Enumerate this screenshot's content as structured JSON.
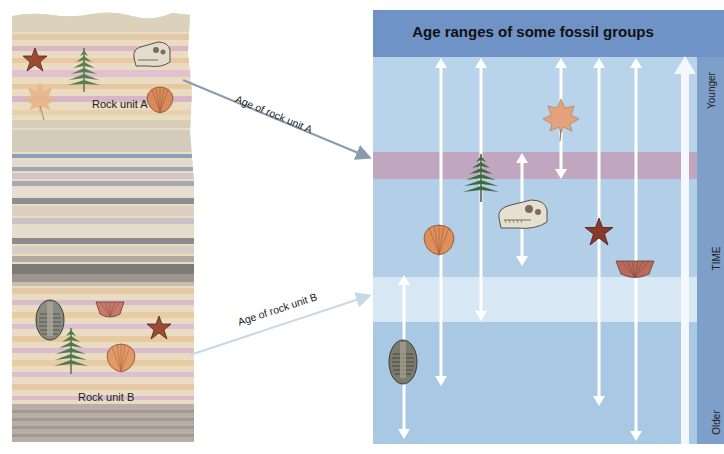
{
  "left_column": {
    "rock_unit_a_label": "Rock unit A",
    "rock_unit_b_label": "Rock unit B",
    "rock_unit_a_fossils": [
      "starfish",
      "fern",
      "dinosaur-skull",
      "maple-leaf",
      "scallop-shell"
    ],
    "rock_unit_b_fossils": [
      "trilobite",
      "brachiopod",
      "starfish",
      "fern",
      "scallop-shell"
    ]
  },
  "connectors": {
    "unit_a_label": "Age of rock unit A",
    "unit_b_label": "Age of rock unit B"
  },
  "panel": {
    "title": "Age ranges of some fossil groups",
    "time_axis": {
      "label": "TIME",
      "top_label": "Younger",
      "bottom_label": "Older"
    },
    "fossil_ranges": [
      {
        "group": "trilobite",
        "x": 31,
        "y_top": 265,
        "y_bottom": 428
      },
      {
        "group": "scallop-shell",
        "x": 68,
        "y_top": 48,
        "y_bottom": 375
      },
      {
        "group": "fern",
        "x": 108,
        "y_top": 48,
        "y_bottom": 310
      },
      {
        "group": "dinosaur-skull",
        "x": 149,
        "y_top": 143,
        "y_bottom": 255
      },
      {
        "group": "maple-leaf",
        "x": 188,
        "y_top": 48,
        "y_bottom": 168
      },
      {
        "group": "starfish",
        "x": 226,
        "y_top": 48,
        "y_bottom": 395
      },
      {
        "group": "brachiopod",
        "x": 263,
        "y_top": 48,
        "y_bottom": 430
      }
    ]
  },
  "colors": {
    "header_blue": "#6f93c6",
    "panel_light_blue": "#b6d2ea",
    "unit_a_band": "#c1a6bf",
    "unit_b_band": "#d7e7f3",
    "lower_band": "#a9c8e3",
    "time_column": "#7e9fc9",
    "arrow_white": "#ffffff",
    "connector_a": "#8a9bb0",
    "connector_b": "#c7d8e6"
  }
}
